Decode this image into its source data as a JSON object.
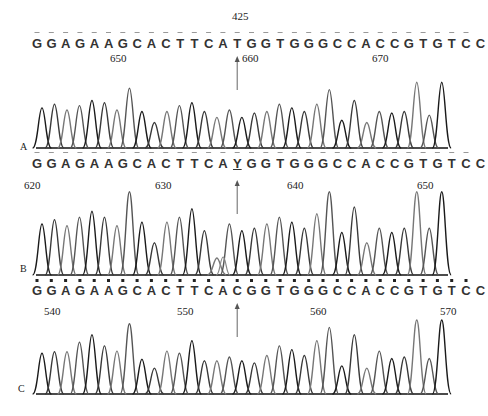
{
  "chart_data": {
    "type": "line",
    "annotation_top": "425",
    "panels": [
      {
        "label": "A",
        "sequence": [
          "G",
          "G",
          "A",
          "G",
          "A",
          "A",
          "G",
          "C",
          "A",
          "C",
          "T",
          "T",
          "C",
          "A",
          "T",
          "G",
          "G",
          "T",
          "G",
          "G",
          "G",
          "C",
          "C",
          "A",
          "C",
          "C",
          "G",
          "T",
          "G",
          "T",
          "C",
          "C"
        ],
        "position_ticks": [
          {
            "label": "650",
            "x": 118
          },
          {
            "label": "660",
            "x": 250
          },
          {
            "label": "670",
            "x": 380
          }
        ],
        "arrow_base_index": 14,
        "peak_heights": [
          0.55,
          0.6,
          0.52,
          0.58,
          0.65,
          0.62,
          0.52,
          0.82,
          0.5,
          0.35,
          0.5,
          0.58,
          0.62,
          0.5,
          0.42,
          0.52,
          0.42,
          0.48,
          0.5,
          0.6,
          0.55,
          0.5,
          0.6,
          0.8,
          0.38,
          0.65,
          0.35,
          0.5,
          0.48,
          0.5,
          0.9,
          0.45,
          0.9
        ]
      },
      {
        "label": "B",
        "sequence": [
          "G",
          "G",
          "A",
          "G",
          "A",
          "A",
          "G",
          "C",
          "A",
          "C",
          "T",
          "T",
          "C",
          "A",
          "Y",
          "G",
          "G",
          "T",
          "G",
          "G",
          "G",
          "C",
          "C",
          "A",
          "C",
          "C",
          "G",
          "T",
          "G",
          "T",
          "C",
          "C"
        ],
        "underlined_index": 14,
        "position_ticks": [
          {
            "label": "620",
            "x": 32
          },
          {
            "label": "630",
            "x": 163
          },
          {
            "label": "640",
            "x": 295
          },
          {
            "label": "650",
            "x": 425
          }
        ],
        "arrow_base_index": 14,
        "peak_heights": [
          0.6,
          0.65,
          0.58,
          0.68,
          0.75,
          0.68,
          0.58,
          0.98,
          0.62,
          0.38,
          0.62,
          0.68,
          0.78,
          0.52,
          0.2,
          0.6,
          0.52,
          0.55,
          0.6,
          0.68,
          0.62,
          0.55,
          0.72,
          0.98,
          0.5,
          0.8,
          0.38,
          0.55,
          0.5,
          0.55,
          0.98,
          0.55,
          0.98
        ]
      },
      {
        "label": "C",
        "sequence": [
          "G",
          "G",
          "A",
          "G",
          "A",
          "A",
          "G",
          "C",
          "A",
          "C",
          "T",
          "T",
          "C",
          "A",
          "C",
          "G",
          "G",
          "T",
          "G",
          "G",
          "G",
          "C",
          "C",
          "A",
          "C",
          "C",
          "G",
          "T",
          "G",
          "T",
          "C",
          "C"
        ],
        "position_ticks": [
          {
            "label": "540",
            "x": 52
          },
          {
            "label": "550",
            "x": 185
          },
          {
            "label": "560",
            "x": 318
          },
          {
            "label": "570",
            "x": 448
          }
        ],
        "arrow_base_index": 14,
        "peak_heights": [
          0.55,
          0.57,
          0.57,
          0.7,
          0.8,
          0.65,
          0.58,
          0.95,
          0.47,
          0.35,
          0.58,
          0.55,
          0.72,
          0.45,
          0.45,
          0.5,
          0.45,
          0.42,
          0.52,
          0.65,
          0.6,
          0.52,
          0.72,
          0.9,
          0.38,
          0.8,
          0.35,
          0.58,
          0.48,
          0.5,
          1.0,
          0.48,
          1.0
        ]
      }
    ],
    "xlabel": "",
    "ylabel": "",
    "grid": false
  }
}
